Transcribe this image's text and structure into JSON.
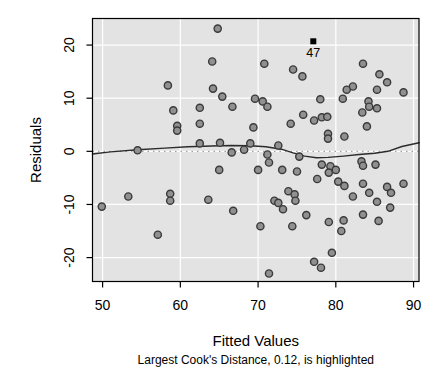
{
  "window": {
    "width": 439,
    "height": 377,
    "background": "#ffffff"
  },
  "chart_data": {
    "type": "scatter",
    "title": "",
    "xlabel": "Fitted Values",
    "ylabel": "Residuals",
    "subtitle": "Largest Cook's Distance, 0.12, is highlighted",
    "xlim": [
      48.7,
      90.7
    ],
    "ylim": [
      -24.5,
      25.0
    ],
    "x_ticks": [
      50,
      60,
      70,
      80,
      90
    ],
    "y_ticks": [
      -20,
      -10,
      0,
      10,
      20
    ],
    "grid": true,
    "legend_position": "none",
    "zero_reference_line": 0,
    "points": [
      [
        64.8,
        23.1
      ],
      [
        64.1,
        16.9
      ],
      [
        58.4,
        12.4
      ],
      [
        64.2,
        11.8
      ],
      [
        65.4,
        10.3
      ],
      [
        59.1,
        7.7
      ],
      [
        62.5,
        8.2
      ],
      [
        66.7,
        8.4
      ],
      [
        59.6,
        4.8
      ],
      [
        59.6,
        3.9
      ],
      [
        62.5,
        5.2
      ],
      [
        69.4,
        4.5
      ],
      [
        69.6,
        9.9
      ],
      [
        70.8,
        16.5
      ],
      [
        74.5,
        15.4
      ],
      [
        75.7,
        14.1
      ],
      [
        78.0,
        9.8
      ],
      [
        70.6,
        9.4
      ],
      [
        71.2,
        8.4
      ],
      [
        75.8,
        6.9
      ],
      [
        78.2,
        6.4
      ],
      [
        78.9,
        6.5
      ],
      [
        77.2,
        5.8
      ],
      [
        74.2,
        5.2
      ],
      [
        79.0,
        3.3
      ],
      [
        79.0,
        2.4
      ],
      [
        72.6,
        1.1
      ],
      [
        83.5,
        16.5
      ],
      [
        85.6,
        14.5
      ],
      [
        86.6,
        13.0
      ],
      [
        82.2,
        12.2
      ],
      [
        81.4,
        11.6
      ],
      [
        85.3,
        11.6
      ],
      [
        88.7,
        11.1
      ],
      [
        80.9,
        9.9
      ],
      [
        84.2,
        9.4
      ],
      [
        84.3,
        8.4
      ],
      [
        85.3,
        8.1
      ],
      [
        83.4,
        7.3
      ],
      [
        84.0,
        4.7
      ],
      [
        81.1,
        2.8
      ],
      [
        54.5,
        0.2
      ],
      [
        62.5,
        1.5
      ],
      [
        65.1,
        1.6
      ],
      [
        66.6,
        -0.2
      ],
      [
        68.2,
        0.3
      ],
      [
        69.0,
        1.5
      ],
      [
        71.2,
        -0.6
      ],
      [
        75.3,
        -1.0
      ],
      [
        83.3,
        -1.9
      ],
      [
        83.5,
        -2.7
      ],
      [
        85.1,
        -2.5
      ],
      [
        65.0,
        -3.5
      ],
      [
        70.0,
        -3.5
      ],
      [
        71.4,
        -2.1
      ],
      [
        73.1,
        -3.5
      ],
      [
        75.0,
        -3.8
      ],
      [
        78.2,
        -2.5
      ],
      [
        79.3,
        -2.8
      ],
      [
        80.0,
        -3.5
      ],
      [
        79.1,
        -4.0
      ],
      [
        77.6,
        -5.2
      ],
      [
        80.3,
        -5.7
      ],
      [
        81.1,
        -6.5
      ],
      [
        82.2,
        -8.5
      ],
      [
        83.5,
        -6.1
      ],
      [
        84.3,
        -7.8
      ],
      [
        86.6,
        -6.7
      ],
      [
        87.1,
        -7.8
      ],
      [
        88.7,
        -6.1
      ],
      [
        85.3,
        -9.5
      ],
      [
        87.0,
        -10.6
      ],
      [
        49.9,
        -10.4
      ],
      [
        53.3,
        -8.5
      ],
      [
        58.7,
        -8.0
      ],
      [
        58.7,
        -9.3
      ],
      [
        63.6,
        -9.1
      ],
      [
        66.8,
        -11.2
      ],
      [
        57.1,
        -15.7
      ],
      [
        72.1,
        -9.3
      ],
      [
        72.6,
        -9.7
      ],
      [
        73.9,
        -7.5
      ],
      [
        74.7,
        -8.1
      ],
      [
        74.8,
        -9.3
      ],
      [
        73.2,
        -10.9
      ],
      [
        76.2,
        -12.0
      ],
      [
        70.3,
        -14.1
      ],
      [
        74.4,
        -14.1
      ],
      [
        79.1,
        -13.3
      ],
      [
        81.0,
        -13.0
      ],
      [
        80.7,
        -15.0
      ],
      [
        83.5,
        -11.9
      ],
      [
        85.5,
        -13.1
      ],
      [
        79.5,
        -19.1
      ],
      [
        77.2,
        -20.8
      ],
      [
        78.1,
        -21.9
      ],
      [
        71.4,
        -23.0
      ]
    ],
    "highlighted_point": {
      "x": 77.1,
      "y": 20.7,
      "label": "47",
      "cooks_distance": 0.12,
      "marker": "filled-square"
    },
    "smooth_line": [
      [
        48.7,
        -0.5
      ],
      [
        51.0,
        -0.1
      ],
      [
        54.5,
        0.3
      ],
      [
        58.0,
        0.6
      ],
      [
        61.0,
        0.85
      ],
      [
        64.0,
        1.0
      ],
      [
        66.5,
        1.1
      ],
      [
        69.0,
        1.05
      ],
      [
        71.0,
        0.85
      ],
      [
        73.0,
        0.4
      ],
      [
        74.5,
        -0.3
      ],
      [
        76.0,
        -0.9
      ],
      [
        77.5,
        -1.2
      ],
      [
        79.0,
        -1.15
      ],
      [
        81.0,
        -0.9
      ],
      [
        83.0,
        -0.6
      ],
      [
        85.0,
        -0.35
      ],
      [
        86.7,
        0.0
      ],
      [
        88.5,
        0.9
      ],
      [
        90.7,
        1.6
      ]
    ],
    "colors": {
      "panel_background": "#e3e3e3",
      "gridline": "#ffffff",
      "point_fill": "#909090",
      "point_stroke": "#3a3a3a",
      "smooth_line": "#2b2b2b",
      "zero_line": "#8f8f8f",
      "highlight": "#000000",
      "axis_text": "#000000",
      "panel_border": "#000000"
    }
  }
}
